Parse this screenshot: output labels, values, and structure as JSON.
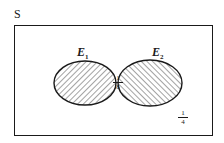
{
  "diagram": {
    "type": "venn",
    "sample_space_label": "S",
    "sets": [
      {
        "name": "E",
        "subscript": "1",
        "hatch": "forward-slash"
      },
      {
        "name": "E",
        "subscript": "2",
        "hatch": "back-slash"
      }
    ],
    "intersection_probability": {
      "numerator": "1",
      "denominator": "8"
    },
    "outside_probability": {
      "numerator": "1",
      "denominator": "4"
    }
  },
  "colors": {
    "ink": "#1a1a1a",
    "background": "#ffffff"
  }
}
